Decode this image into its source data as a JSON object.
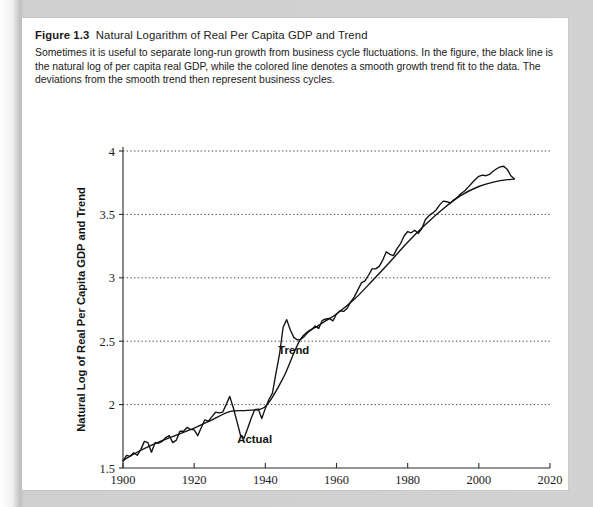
{
  "figure": {
    "number": "Figure 1.3",
    "title": "Natural Logarithm of Real Per Capita GDP and Trend",
    "description": "Sometimes it is useful to separate long-run growth from business cycle fluctuations. In the figure, the black line is the natural log of per capita real GDP, while the colored line denotes a smooth growth trend fit to the data. The deviations from the smooth trend then represent business cycles."
  },
  "colors": {
    "page_background": "#c9c9c9",
    "card_background": "#ffffff",
    "actual_line": "#111111",
    "trend_line": "#111111",
    "axis": "#2b2b2b",
    "text": "#1a1a1a"
  },
  "chart_data": {
    "type": "line",
    "title": "Natural Logarithm of Real Per Capita GDP and Trend",
    "xlabel": "Year",
    "ylabel": "Natural Log of Real Per Capita GDP and Trend",
    "xlim": [
      1900,
      2020
    ],
    "ylim": [
      1.5,
      4.0
    ],
    "xticks": [
      1900,
      1920,
      1940,
      1960,
      1980,
      2000,
      2020
    ],
    "xtick_labels": [
      "1900",
      "1920",
      "1940",
      "1960",
      "1980",
      "2000",
      "2020"
    ],
    "yticks": [
      1.5,
      2,
      2.5,
      3,
      3.5,
      4
    ],
    "ytick_labels": [
      "1.5",
      "2",
      "2.5",
      "3",
      "3.5",
      "4"
    ],
    "grid": "horizontal-dotted",
    "legend": "inline-annotations",
    "annotations": [
      {
        "label": "Trend",
        "x": 1948,
        "y": 2.4
      },
      {
        "label": "Actual",
        "x": 1937,
        "y": 1.7
      }
    ],
    "series": [
      {
        "name": "Actual",
        "x": [
          1900,
          1901,
          1902,
          1903,
          1904,
          1905,
          1906,
          1907,
          1908,
          1909,
          1910,
          1911,
          1912,
          1913,
          1914,
          1915,
          1916,
          1917,
          1918,
          1919,
          1920,
          1921,
          1922,
          1923,
          1924,
          1925,
          1926,
          1927,
          1928,
          1929,
          1930,
          1931,
          1932,
          1933,
          1934,
          1935,
          1936,
          1937,
          1938,
          1939,
          1940,
          1941,
          1942,
          1943,
          1944,
          1945,
          1946,
          1947,
          1948,
          1949,
          1950,
          1951,
          1952,
          1953,
          1954,
          1955,
          1956,
          1957,
          1958,
          1959,
          1960,
          1961,
          1962,
          1963,
          1964,
          1965,
          1966,
          1967,
          1968,
          1969,
          1970,
          1971,
          1972,
          1973,
          1974,
          1975,
          1976,
          1977,
          1978,
          1979,
          1980,
          1981,
          1982,
          1983,
          1984,
          1985,
          1986,
          1987,
          1988,
          1989,
          1990,
          1991,
          1992,
          1993,
          1994,
          1995,
          1996,
          1997,
          1998,
          1999,
          2000,
          2001,
          2002,
          2003,
          2004,
          2005,
          2006,
          2007,
          2008,
          2009,
          2010
        ],
        "y": [
          1.555,
          1.6,
          1.592,
          1.62,
          1.6,
          1.645,
          1.71,
          1.7,
          1.625,
          1.7,
          1.695,
          1.71,
          1.74,
          1.755,
          1.7,
          1.72,
          1.79,
          1.79,
          1.82,
          1.805,
          1.8,
          1.755,
          1.82,
          1.88,
          1.87,
          1.905,
          1.94,
          1.935,
          1.94,
          2.0,
          2.065,
          1.975,
          1.87,
          1.76,
          1.735,
          1.81,
          1.89,
          1.96,
          1.965,
          1.89,
          1.97,
          2.04,
          2.09,
          2.25,
          2.4,
          2.61,
          2.67,
          2.59,
          2.53,
          2.51,
          2.515,
          2.54,
          2.57,
          2.59,
          2.62,
          2.6,
          2.665,
          2.675,
          2.68,
          2.66,
          2.715,
          2.74,
          2.735,
          2.76,
          2.81,
          2.85,
          2.905,
          2.96,
          2.975,
          3.02,
          3.07,
          3.07,
          3.09,
          3.14,
          3.205,
          3.185,
          3.175,
          3.23,
          3.27,
          3.33,
          3.365,
          3.355,
          3.375,
          3.35,
          3.39,
          3.46,
          3.49,
          3.51,
          3.535,
          3.575,
          3.605,
          3.6,
          3.59,
          3.615,
          3.635,
          3.665,
          3.685,
          3.715,
          3.745,
          3.775,
          3.8,
          3.81,
          3.805,
          3.815,
          3.84,
          3.86,
          3.875,
          3.88,
          3.855,
          3.805,
          3.78
        ]
      },
      {
        "name": "Trend",
        "x": [
          1900,
          1905,
          1910,
          1915,
          1920,
          1925,
          1930,
          1935,
          1940,
          1945,
          1950,
          1955,
          1960,
          1965,
          1970,
          1975,
          1980,
          1985,
          1990,
          1995,
          2000,
          2005,
          2010
        ],
        "y": [
          1.56,
          1.64,
          1.705,
          1.76,
          1.815,
          1.88,
          1.945,
          1.955,
          1.985,
          2.21,
          2.52,
          2.625,
          2.715,
          2.83,
          2.975,
          3.125,
          3.28,
          3.42,
          3.545,
          3.65,
          3.72,
          3.76,
          3.78
        ]
      }
    ]
  },
  "plot_geometry": {
    "left": 101,
    "right": 528,
    "top": 133,
    "bottom": 450
  }
}
